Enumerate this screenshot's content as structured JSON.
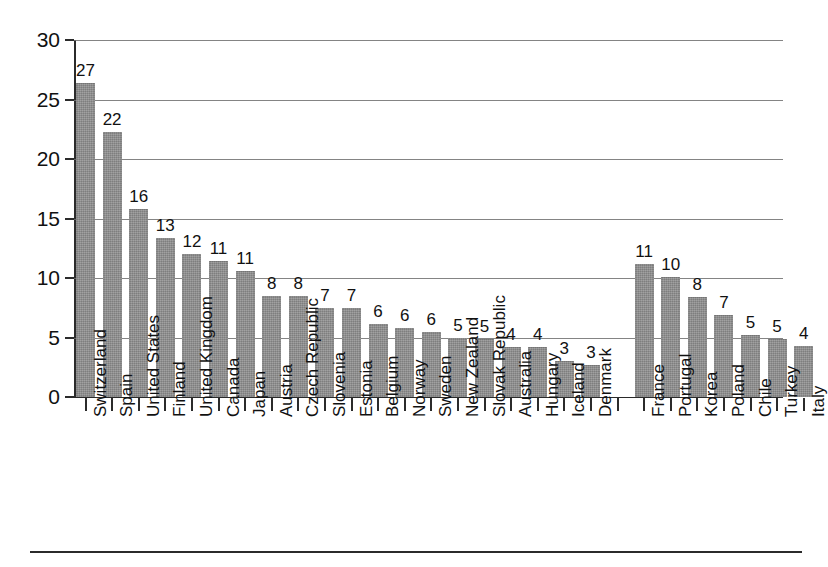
{
  "chart_data": {
    "type": "bar",
    "title": "",
    "subtitle": "",
    "xlabel": "",
    "ylabel": "",
    "ylim": [
      0,
      30
    ],
    "yticks": [
      0,
      5,
      10,
      15,
      20,
      25,
      30
    ],
    "grid": true,
    "legend": null,
    "orientation": "vertical",
    "value_labels": true,
    "bar_color": "#8d8d8d",
    "groups": [
      {
        "name": "group-1",
        "categories": [
          "Switzerland",
          "Spain",
          "United States",
          "Finland",
          "United Kingdom",
          "Canada",
          "Japan",
          "Austria",
          "Czech Republic",
          "Slovenia",
          "Estonia",
          "Belgium",
          "Norway",
          "Sweden",
          "New Zealand",
          "Slovak Republic",
          "Australia",
          "Hungary",
          "Iceland",
          "Denmark"
        ],
        "labels": [
          27,
          22,
          16,
          13,
          12,
          11,
          11,
          8,
          8,
          7,
          7,
          6,
          6,
          6,
          5,
          5,
          4,
          4,
          3,
          3
        ],
        "values": [
          26.4,
          22.3,
          15.8,
          13.4,
          12.0,
          11.4,
          10.6,
          8.5,
          8.5,
          7.5,
          7.5,
          6.1,
          5.8,
          5.5,
          5.0,
          4.9,
          4.2,
          4.2,
          3.0,
          2.7
        ]
      },
      {
        "name": "group-2",
        "categories": [
          "France",
          "Portugal",
          "Korea",
          "Poland",
          "Chile",
          "Turkey",
          "Italy"
        ],
        "labels": [
          11,
          10,
          8,
          7,
          5,
          5,
          4
        ],
        "values": [
          11.2,
          10.1,
          8.4,
          6.9,
          5.2,
          4.9,
          4.3
        ]
      }
    ]
  },
  "axis": {
    "y_tick_labels": [
      "30",
      "25",
      "20",
      "15",
      "10",
      "5",
      "0"
    ]
  }
}
